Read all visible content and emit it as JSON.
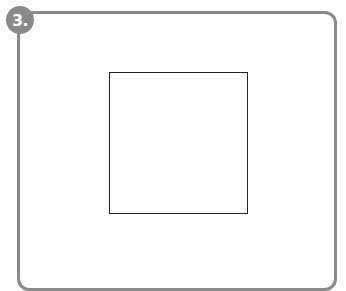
{
  "badge": {
    "label": "3.",
    "color": "#8a8a8a"
  },
  "frame": {
    "border_color": "#8a8a8a"
  },
  "figure": {
    "shape": "square",
    "stroke_color": "#222222"
  }
}
